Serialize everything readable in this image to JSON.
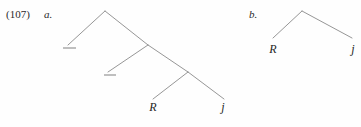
{
  "figure": {
    "example_number": "(107)",
    "label_a": "a.",
    "label_b": "b."
  },
  "tree_a": {
    "leaves": {
      "leaf_1": "R",
      "leaf_2": "j"
    },
    "empty_nodes": {
      "trace_1": "—",
      "trace_2": "—"
    }
  },
  "tree_b": {
    "leaves": {
      "leaf_1": "R",
      "leaf_2": "j"
    }
  },
  "style": {
    "line_color": "#8a8a8a",
    "text_color": "#262626",
    "background": "#fefefe"
  }
}
